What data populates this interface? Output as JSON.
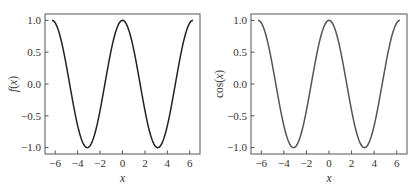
{
  "chart_data": [
    {
      "type": "line",
      "title": "",
      "xlabel": "x",
      "ylabel": "f(x)",
      "xlim": [
        -6.91,
        6.91
      ],
      "ylim": [
        -1.1,
        1.1
      ],
      "xticks": [
        -6,
        -4,
        -2,
        0,
        2,
        4,
        6
      ],
      "xtick_labels": [
        "−6",
        "−4",
        "−2",
        "0",
        "2",
        "4",
        "6"
      ],
      "yticks": [
        -1.0,
        -0.5,
        0.0,
        0.5,
        1.0
      ],
      "ytick_labels": [
        "−1.0",
        "−0.5",
        "0.0",
        "0.5",
        "1.0"
      ],
      "grid": false,
      "legend": null,
      "series": [
        {
          "name": "f(x)",
          "function": "cos(x)",
          "domain": [
            -6.2832,
            6.2832
          ],
          "color": "#222222",
          "x": [
            -6.283,
            -4.712,
            -3.142,
            -1.571,
            0,
            1.571,
            3.142,
            4.712,
            6.283
          ],
          "y": [
            1.0,
            0.0,
            -1.0,
            0.0,
            1.0,
            0.0,
            -1.0,
            0.0,
            1.0
          ]
        }
      ]
    },
    {
      "type": "line",
      "title": "",
      "xlabel": "x",
      "ylabel": "cos(x)",
      "xlim": [
        -6.91,
        6.91
      ],
      "ylim": [
        -1.1,
        1.1
      ],
      "xticks": [
        -6,
        -4,
        -2,
        0,
        2,
        4,
        6
      ],
      "xtick_labels": [
        "−6",
        "−4",
        "−2",
        "0",
        "2",
        "4",
        "6"
      ],
      "yticks": [
        -1.0,
        -0.5,
        0.0,
        0.5,
        1.0
      ],
      "ytick_labels": [
        "−1.0",
        "−0.5",
        "0.0",
        "0.5",
        "1.0"
      ],
      "grid": false,
      "legend": null,
      "series": [
        {
          "name": "cos(x)",
          "function": "cos(x)",
          "domain": [
            -6.2832,
            6.2832
          ],
          "color": "#555555",
          "x": [
            -6.283,
            -4.712,
            -3.142,
            -1.571,
            0,
            1.571,
            3.142,
            4.712,
            6.283
          ],
          "y": [
            1.0,
            0.0,
            -1.0,
            0.0,
            1.0,
            0.0,
            -1.0,
            0.0,
            1.0
          ]
        }
      ]
    }
  ],
  "panels": [
    {
      "frame": {
        "x": 45,
        "y": 14,
        "w": 155,
        "h": 140
      },
      "ylabel_x": 13
    },
    {
      "frame": {
        "x": 251,
        "y": 14,
        "w": 156,
        "h": 140
      },
      "ylabel_x": 219
    }
  ]
}
